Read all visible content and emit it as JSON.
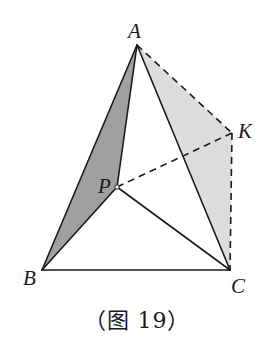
{
  "figure": {
    "caption": "（图 19）",
    "colors": {
      "stroke": "#1a1a1a",
      "face_ABP_fill": "#a0a0a0",
      "face_AKC_fill": "#dcdcdc",
      "background": "#ffffff"
    },
    "vertices": {
      "A": {
        "label": "A",
        "x": 137,
        "y": 45
      },
      "K": {
        "label": "K",
        "x": 232,
        "y": 133
      },
      "P": {
        "label": "P",
        "x": 117,
        "y": 187
      },
      "B": {
        "label": "B",
        "x": 42,
        "y": 270
      },
      "C": {
        "label": "C",
        "x": 230,
        "y": 270
      }
    },
    "faces": [
      {
        "name": "ABP",
        "points": [
          "A",
          "B",
          "P"
        ],
        "shade": "dark"
      },
      {
        "name": "AKC",
        "points": [
          "A",
          "K",
          "C"
        ],
        "shade": "light"
      }
    ],
    "solid_edges": [
      [
        "A",
        "B"
      ],
      [
        "A",
        "P"
      ],
      [
        "A",
        "C"
      ],
      [
        "B",
        "C"
      ],
      [
        "B",
        "P"
      ],
      [
        "P",
        "C"
      ]
    ],
    "dashed_edges": [
      [
        "A",
        "K"
      ],
      [
        "K",
        "C"
      ],
      [
        "P",
        "K"
      ]
    ]
  }
}
